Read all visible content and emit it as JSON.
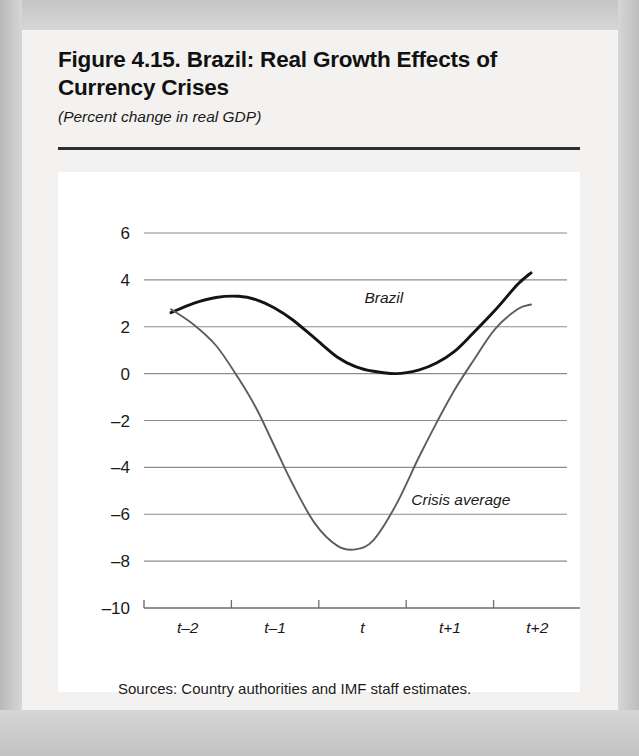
{
  "figure": {
    "title": "Figure 4.15. Brazil: Real Growth Effects of Currency Crises",
    "subtitle": "(Percent change in real GDP)",
    "source_note": "Sources: Country authorities and IMF staff estimates."
  },
  "colors": {
    "brazil_line": "#141414",
    "crisis_line": "#5d5d5d",
    "gridline": "#8c8c8c",
    "axis": "#6e6e6e",
    "text": "#1a1a1a",
    "panel_background": "#ffffff",
    "card_background": "#f3f2f0",
    "page_background": "#d2d2d2"
  },
  "chart_data": {
    "type": "line",
    "title": "Figure 4.15. Brazil: Real Growth Effects of Currency Crises",
    "subtitle": "(Percent change in real GDP)",
    "xlabel": "",
    "ylabel": "",
    "ylim": [
      -10,
      6
    ],
    "xlim": [
      -2.35,
      2.35
    ],
    "grid": true,
    "legend_position": "inline-annotation",
    "ytick_labels": [
      "6",
      "4",
      "2",
      "0",
      "–2",
      "–4",
      "–6",
      "–8",
      "–10"
    ],
    "ytick_values": [
      6,
      4,
      2,
      0,
      -2,
      -4,
      -6,
      -8,
      -10
    ],
    "xtick_labels": [
      "t–2",
      "t–1",
      "t",
      "t+1",
      "t+2"
    ],
    "xtick_values": [
      -2,
      -1,
      0,
      1,
      2
    ],
    "x": [
      -2.05,
      -1.8,
      -1.55,
      -1.3,
      -1.1,
      -0.9,
      -0.7,
      -0.45,
      -0.2,
      0.0,
      0.2,
      0.45,
      0.7,
      0.9,
      1.1,
      1.3,
      1.55,
      1.8,
      1.95
    ],
    "series": [
      {
        "name": "Brazil",
        "color": "#141414",
        "label_x": 0.1,
        "label_y": 3.0,
        "values": [
          2.6,
          3.0,
          3.25,
          3.3,
          3.15,
          2.8,
          2.3,
          1.5,
          0.7,
          0.3,
          0.1,
          0.0,
          0.15,
          0.45,
          0.95,
          1.7,
          2.7,
          3.8,
          4.3
        ]
      },
      {
        "name": "Crisis average",
        "color": "#5d5d5d",
        "label_x": 0.62,
        "label_y": -5.6,
        "values": [
          2.75,
          2.1,
          1.2,
          -0.2,
          -1.5,
          -3.1,
          -4.7,
          -6.4,
          -7.35,
          -7.5,
          -7.1,
          -5.6,
          -3.6,
          -2.1,
          -0.7,
          0.5,
          1.9,
          2.75,
          2.95
        ]
      }
    ],
    "annotations": [
      {
        "text": "Brazil",
        "series": "Brazil"
      },
      {
        "text": "Crisis average",
        "series": "Crisis average"
      }
    ]
  }
}
